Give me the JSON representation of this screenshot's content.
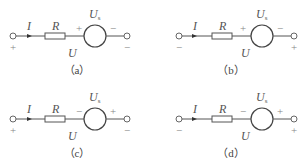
{
  "figure": {
    "panels": [
      {
        "id": "a",
        "caption": "（a）",
        "current_label": "I",
        "resistor_label": "R",
        "source_label": "U",
        "source_sub": "s",
        "voltage_label": "U",
        "terminal_left_sign": "+",
        "terminal_right_sign": "−",
        "source_left_sign": "+",
        "source_right_sign": "−"
      },
      {
        "id": "b",
        "caption": "（b）",
        "current_label": "I",
        "resistor_label": "R",
        "source_label": "U",
        "source_sub": "s",
        "voltage_label": "U",
        "terminal_left_sign": "−",
        "terminal_right_sign": "+",
        "source_left_sign": "+",
        "source_right_sign": "−"
      },
      {
        "id": "c",
        "caption": "（c）",
        "current_label": "I",
        "resistor_label": "R",
        "source_label": "U",
        "source_sub": "s",
        "voltage_label": "U",
        "terminal_left_sign": "+",
        "terminal_right_sign": "−",
        "source_left_sign": "−",
        "source_right_sign": "+"
      },
      {
        "id": "d",
        "caption": "（d）",
        "current_label": "I",
        "resistor_label": "R",
        "source_label": "U",
        "source_sub": "s",
        "voltage_label": "U",
        "terminal_left_sign": "−",
        "terminal_right_sign": "+",
        "source_left_sign": "−",
        "source_right_sign": "+"
      }
    ],
    "colors": {
      "line": "#555555",
      "text": "#555555",
      "background": "#ffffff"
    }
  }
}
